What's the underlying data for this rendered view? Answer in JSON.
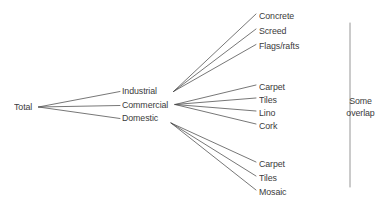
{
  "diagram": {
    "type": "tree",
    "stroke_color": "#4a4a4a",
    "text_color": "#3b3b3b",
    "background_color": "#ffffff",
    "root": {
      "label": "Total",
      "x": 14,
      "y": 107
    },
    "level1": [
      {
        "label": "Industrial",
        "x": 122,
        "y": 91,
        "hub_x": 173,
        "hub_y": 91
      },
      {
        "label": "Commercial",
        "x": 122,
        "y": 105,
        "hub_x": 175,
        "hub_y": 104
      },
      {
        "label": "Domestic",
        "x": 122,
        "y": 118,
        "hub_x": 171,
        "hub_y": 123
      }
    ],
    "level2": {
      "industrial": [
        {
          "label": "Concrete",
          "x": 259,
          "y": 16
        },
        {
          "label": "Screed",
          "x": 259,
          "y": 31
        },
        {
          "label": "Flags/rafts",
          "x": 259,
          "y": 46
        }
      ],
      "commercial": [
        {
          "label": "Carpet",
          "x": 259,
          "y": 87
        },
        {
          "label": "Tiles",
          "x": 259,
          "y": 100
        },
        {
          "label": "Lino",
          "x": 259,
          "y": 113
        },
        {
          "label": "Cork",
          "x": 259,
          "y": 126
        }
      ],
      "domestic": [
        {
          "label": "Carpet",
          "x": 259,
          "y": 164
        },
        {
          "label": "Tiles",
          "x": 259,
          "y": 178
        },
        {
          "label": "Mosaic",
          "x": 259,
          "y": 192
        }
      ]
    },
    "annotation": {
      "line1": "Some",
      "line2": "overlap",
      "x": 366,
      "y": 106,
      "bracket": {
        "x": 350,
        "y_top": 23,
        "y_bottom": 187
      }
    }
  }
}
